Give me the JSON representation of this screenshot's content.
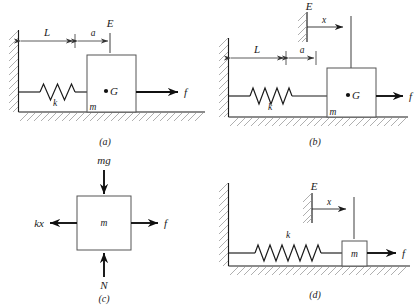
{
  "figure": {
    "colors": {
      "line": "#1a1a1a",
      "hatch": "#8d8d8d",
      "block_stroke": "#555555",
      "background": "#ffffff"
    }
  },
  "panels": [
    {
      "id": "a",
      "caption": "(a)",
      "description": "Block of mass m on ground, attached by spring k to left wall, force f applied to right; center of gravity G marked; dimensions L and a to reference line E.",
      "labels": {
        "length_L": "L",
        "length_a": "a",
        "reference_E": "E",
        "spring_k": "k",
        "mass_m": "m",
        "center_G": "G",
        "force_f": "f"
      }
    },
    {
      "id": "b",
      "caption": "(b)",
      "description": "Same system displaced; hatched reference line E with displacement x measured to block line; dimensions L and a shown.",
      "labels": {
        "length_L": "L",
        "length_a": "a",
        "reference_E": "E",
        "displacement_x": "x",
        "spring_k": "k",
        "mass_m": "m",
        "center_G": "G",
        "force_f": "f"
      }
    },
    {
      "id": "c",
      "caption": "(c)",
      "description": "Free-body diagram of mass m with weight mg down, normal force N up, spring force kx to the left, applied force f to the right.",
      "labels": {
        "weight_mg": "mg",
        "normal_N": "N",
        "spring_force_kx": "kx",
        "mass_m": "m",
        "force_f": "f"
      }
    },
    {
      "id": "d",
      "caption": "(d)",
      "description": "Simplified schematic: small block m on ground connected by spring k to wall, force f to right, displacement x from hatched reference line E.",
      "labels": {
        "reference_E": "E",
        "displacement_x": "x",
        "spring_k": "k",
        "mass_m": "m",
        "force_f": "f"
      }
    }
  ]
}
